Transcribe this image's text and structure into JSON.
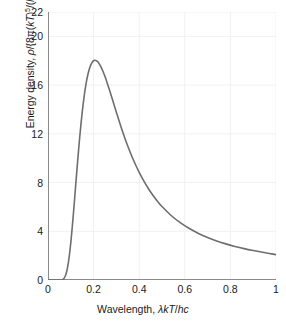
{
  "chart_data": {
    "type": "line",
    "title": "",
    "subtitle": "",
    "xlabel": "Wavelength, λkT/hc",
    "xlabel_plain": "Wavelength, lambda kT/hc",
    "ylabel": "Energy density, ρ/{8π(kT)⁵/(hc)⁴}",
    "ylabel_plain": "Energy density, rho/{8pi(kT)^5/(hc)^4}",
    "xlim": [
      0,
      1
    ],
    "ylim": [
      0,
      22
    ],
    "xticks": [
      "0",
      "0.2",
      "0.4",
      "0.6",
      "0.8",
      "1"
    ],
    "xtick_values": [
      0,
      0.2,
      0.4,
      0.6,
      0.8,
      1
    ],
    "yticks": [
      "0",
      "4",
      "8",
      "12",
      "16",
      "20",
      "22"
    ],
    "ytick_values": [
      0,
      4,
      8,
      12,
      16,
      20,
      22
    ],
    "grid": true,
    "grid_color": "#f0f0f0",
    "legend": null,
    "line_color": "#6e6e6e",
    "line_width": 1.6,
    "annotations": [],
    "series": [
      {
        "name": "Planck distribution",
        "peak_x": 0.2014,
        "peak_y": 21.0,
        "x": [
          0.0,
          0.01,
          0.02,
          0.03,
          0.04,
          0.05,
          0.055,
          0.06,
          0.065,
          0.07,
          0.075,
          0.08,
          0.085,
          0.09,
          0.095,
          0.1,
          0.105,
          0.11,
          0.115,
          0.12,
          0.125,
          0.13,
          0.135,
          0.14,
          0.145,
          0.15,
          0.155,
          0.16,
          0.165,
          0.17,
          0.175,
          0.18,
          0.185,
          0.19,
          0.195,
          0.2,
          0.205,
          0.21,
          0.215,
          0.22,
          0.23,
          0.24,
          0.25,
          0.26,
          0.27,
          0.28,
          0.29,
          0.3,
          0.32,
          0.34,
          0.36,
          0.38,
          0.4,
          0.42,
          0.44,
          0.46,
          0.48,
          0.5,
          0.54,
          0.58,
          0.62,
          0.66,
          0.7,
          0.74,
          0.78,
          0.82,
          0.86,
          0.9,
          0.94,
          0.97,
          1.0
        ],
        "y": [
          0.0,
          0.0,
          0.0,
          0.0,
          0.0,
          0.001,
          0.004,
          0.016,
          0.05,
          0.13,
          0.286,
          0.551,
          0.952,
          1.506,
          2.215,
          3.07,
          4.049,
          5.124,
          6.263,
          7.434,
          8.607,
          9.757,
          10.862,
          11.905,
          12.874,
          13.761,
          14.56,
          15.269,
          15.889,
          16.421,
          16.868,
          17.236,
          17.527,
          17.748,
          17.903,
          17.998,
          18.038,
          18.027,
          17.972,
          17.876,
          17.583,
          17.181,
          16.698,
          16.157,
          15.578,
          14.977,
          14.367,
          13.758,
          12.583,
          11.497,
          10.511,
          9.626,
          8.836,
          8.134,
          7.51,
          6.957,
          6.466,
          6.03,
          5.296,
          4.705,
          4.223,
          3.824,
          3.49,
          3.207,
          2.965,
          2.756,
          2.574,
          2.416,
          2.276,
          2.182,
          2.084
        ]
      }
    ]
  }
}
